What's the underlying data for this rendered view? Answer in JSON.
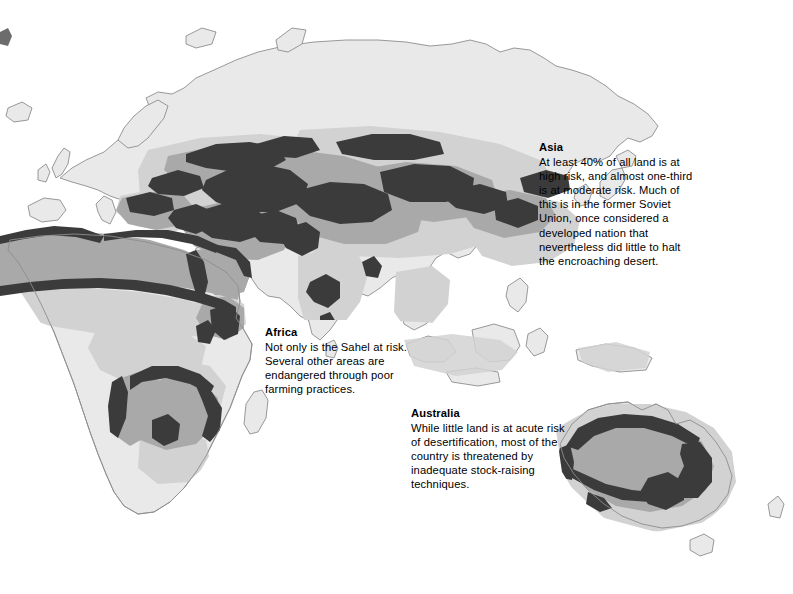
{
  "figure": {
    "kind": "thematic-world-map",
    "projection_note": "Eastern hemisphere: Europe, Africa, Asia, Australia",
    "background_color": "#ffffff"
  },
  "legend_tones": {
    "high_risk_color": "#3b3b3b",
    "moderate_risk_color": "#a9a9a9",
    "low_risk_color": "#d2d2d2",
    "land_base_color": "#e9e9e9",
    "coastline_color": "#8d8d8d"
  },
  "callouts": [
    {
      "id": "asia",
      "title": "Asia",
      "body": "At least 40% of all land is at high risk, and almost one-third is at moderate risk. Much of this is in the former Soviet Union, once considered a developed nation that nevertheless did little to halt the encroaching desert."
    },
    {
      "id": "africa",
      "title": "Africa",
      "body": "Not only is the Sahel at risk. Several other areas are endangered through poor farming practices."
    },
    {
      "id": "australia",
      "title": "Australia",
      "body": "While little land is at acute risk of desertification, most of the country is threatened by inadequate stock-raising techniques."
    }
  ]
}
